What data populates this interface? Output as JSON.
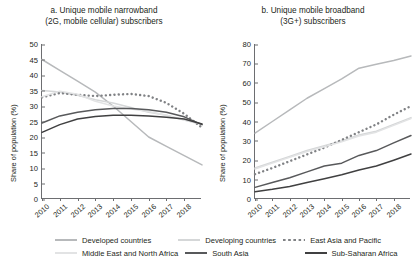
{
  "figure": {
    "panels": [
      {
        "id": "a",
        "title_line1": "a. Unique mobile narrowband",
        "title_line2": "(2G, mobile cellular) subscribers",
        "ylabel": "Share of population (%)"
      },
      {
        "id": "b",
        "title_line1": "b. Unique mobile broadband",
        "title_line2": "(3G+) subscribers",
        "ylabel": "Share of population (%)"
      }
    ]
  },
  "legend": {
    "items": [
      {
        "label": "Developed countries",
        "color": "#b7b9bb",
        "style": "solid"
      },
      {
        "label": "Developing countries",
        "color": "#d5d7d8",
        "style": "solid"
      },
      {
        "label": "East Asia and Pacific",
        "color": "#808285",
        "style": "dotted"
      },
      {
        "label": "Middle East and North Africa",
        "color": "#e2e3e4",
        "style": "solid"
      },
      {
        "label": "South Asia",
        "color": "#58595b",
        "style": "solid"
      },
      {
        "label": "Sub-Saharan Africa",
        "color": "#404041",
        "style": "solid"
      }
    ]
  },
  "chart_data": [
    {
      "type": "line",
      "id": "a",
      "title": "a. Unique mobile narrowband (2G, mobile cellular) subscribers",
      "xlabel": "",
      "ylabel": "Share of population (%)",
      "x": [
        2010,
        2011,
        2012,
        2013,
        2014,
        2015,
        2016,
        2017,
        2018,
        2019
      ],
      "xtick_labels": [
        "2010",
        "2011",
        "2012",
        "2013",
        "2014",
        "2015",
        "2016",
        "2017",
        "2018"
      ],
      "xlim": [
        2010,
        2019
      ],
      "ylim": [
        0,
        50
      ],
      "yticks": [
        0,
        5,
        10,
        15,
        20,
        25,
        30,
        35,
        40,
        45,
        50
      ],
      "grid": false,
      "legend_position": "below",
      "series": [
        {
          "name": "Developed countries",
          "color": "#b7b9bb",
          "style": "solid",
          "values": [
            45.0,
            41.5,
            38.0,
            34.5,
            30.0,
            25.0,
            20.0,
            17.0,
            14.0,
            11.0
          ]
        },
        {
          "name": "Developing countries",
          "color": "#d5d7d8",
          "style": "solid",
          "values": [
            35.0,
            34.5,
            33.5,
            32.0,
            31.0,
            29.5,
            28.0,
            27.0,
            25.5,
            24.0
          ]
        },
        {
          "name": "East Asia and Pacific",
          "color": "#808285",
          "style": "dotted",
          "values": [
            32.8,
            34.2,
            33.6,
            33.2,
            33.6,
            33.9,
            33.2,
            31.0,
            27.5,
            23.0
          ]
        },
        {
          "name": "Middle East and North Africa",
          "color": "#e2e3e4",
          "style": "solid",
          "values": [
            33.0,
            34.8,
            33.8,
            31.5,
            30.0,
            29.0,
            28.2,
            27.0,
            25.5,
            24.2
          ]
        },
        {
          "name": "South Asia",
          "color": "#58595b",
          "style": "solid",
          "values": [
            24.5,
            26.8,
            28.0,
            28.8,
            29.2,
            29.2,
            28.8,
            28.0,
            26.5,
            24.0
          ]
        },
        {
          "name": "Sub-Saharan Africa",
          "color": "#404041",
          "style": "solid",
          "values": [
            21.5,
            24.0,
            25.8,
            26.6,
            27.0,
            27.0,
            26.8,
            26.4,
            25.8,
            24.2
          ]
        }
      ]
    },
    {
      "type": "line",
      "id": "b",
      "title": "b. Unique mobile broadband (3G+) subscribers",
      "xlabel": "",
      "ylabel": "Share of population (%)",
      "x": [
        2010,
        2011,
        2012,
        2013,
        2014,
        2015,
        2016,
        2017,
        2018,
        2019
      ],
      "xtick_labels": [
        "2010",
        "2011",
        "2012",
        "2013",
        "2014",
        "2015",
        "2016",
        "2017",
        "2018"
      ],
      "xlim": [
        2010,
        2019
      ],
      "ylim": [
        0,
        80
      ],
      "yticks": [
        0,
        10,
        20,
        30,
        40,
        50,
        60,
        70,
        80
      ],
      "grid": false,
      "legend_position": "below",
      "series": [
        {
          "name": "Developed countries",
          "color": "#b7b9bb",
          "style": "solid",
          "values": [
            34.0,
            40.0,
            46.0,
            52.0,
            57.0,
            62.0,
            67.5,
            69.5,
            71.5,
            73.8
          ]
        },
        {
          "name": "Developing countries",
          "color": "#d5d7d8",
          "style": "solid",
          "values": [
            16.0,
            19.0,
            22.0,
            25.0,
            27.5,
            30.0,
            33.0,
            35.0,
            38.5,
            42.0
          ]
        },
        {
          "name": "East Asia and Pacific",
          "color": "#808285",
          "style": "dotted",
          "values": [
            12.8,
            16.0,
            19.5,
            23.0,
            26.5,
            30.5,
            34.5,
            38.5,
            43.5,
            48.0
          ]
        },
        {
          "name": "Middle East and North Africa",
          "color": "#e2e3e4",
          "style": "solid",
          "values": [
            15.5,
            18.5,
            21.5,
            24.5,
            27.0,
            29.5,
            32.5,
            34.5,
            38.0,
            41.5
          ]
        },
        {
          "name": "South Asia",
          "color": "#58595b",
          "style": "solid",
          "values": [
            6.0,
            8.5,
            11.0,
            14.0,
            17.0,
            18.5,
            22.5,
            25.0,
            29.0,
            32.8
          ]
        },
        {
          "name": "Sub-Saharan Africa",
          "color": "#404041",
          "style": "solid",
          "values": [
            3.8,
            5.0,
            6.5,
            8.5,
            10.5,
            12.5,
            15.0,
            17.0,
            20.0,
            23.2
          ]
        }
      ]
    }
  ]
}
